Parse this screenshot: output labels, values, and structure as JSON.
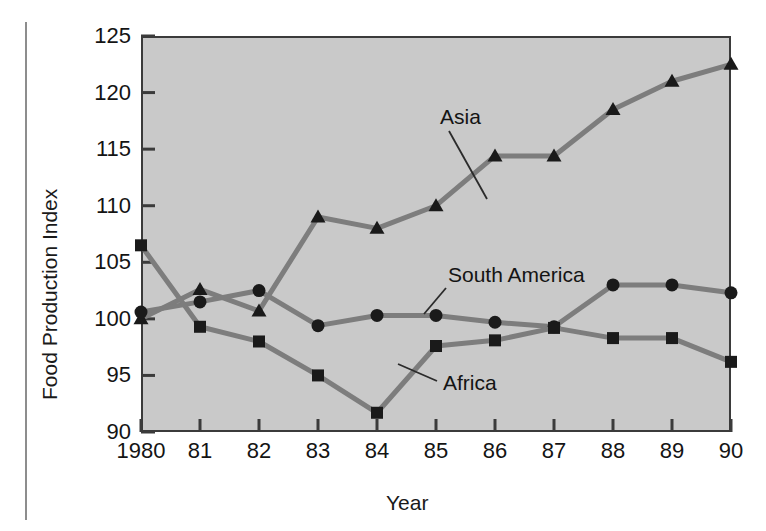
{
  "figure": {
    "background_color": "#ffffff",
    "plot_background_color": "#c9c9c9",
    "line_color": "#7d7d7d",
    "marker_color": "#1a1a1a",
    "axis_color": "#3b3b3b"
  },
  "axis_titles": {
    "y": "Food Production Index",
    "x": "Year"
  },
  "y_ticks": [
    "125",
    "120",
    "115",
    "110",
    "105",
    "100",
    "95",
    "90"
  ],
  "x_ticks": [
    "1980",
    "81",
    "82",
    "83",
    "84",
    "85",
    "86",
    "87",
    "88",
    "89",
    "90"
  ],
  "series_labels": {
    "asia": "Asia",
    "south_america": "South America",
    "africa": "Africa"
  },
  "chart_data": {
    "type": "line",
    "title": "",
    "xlabel": "Year",
    "ylabel": "Food Production Index",
    "x": [
      1980,
      1981,
      1982,
      1983,
      1984,
      1985,
      1986,
      1987,
      1988,
      1989,
      1990
    ],
    "categories": [
      "1980",
      "81",
      "82",
      "83",
      "84",
      "85",
      "86",
      "87",
      "88",
      "89",
      "90"
    ],
    "xlim": [
      1980,
      1990
    ],
    "ylim": [
      90,
      125
    ],
    "ytick_values": [
      90,
      95,
      100,
      105,
      110,
      115,
      120,
      125
    ],
    "grid": false,
    "legend": "inline-annotations",
    "series": [
      {
        "name": "Asia",
        "marker": "triangle",
        "values": [
          100.0,
          102.6,
          100.7,
          109.0,
          108.0,
          110.0,
          114.4,
          114.4,
          118.5,
          121.0,
          122.5
        ]
      },
      {
        "name": "South America",
        "marker": "circle",
        "values": [
          100.6,
          101.5,
          102.5,
          99.4,
          100.3,
          100.3,
          99.7,
          99.3,
          103.0,
          103.0,
          102.3
        ]
      },
      {
        "name": "Africa",
        "marker": "square",
        "values": [
          106.5,
          99.3,
          98.0,
          95.0,
          91.7,
          97.6,
          98.1,
          99.2,
          98.3,
          98.3,
          96.2
        ]
      }
    ],
    "annotations": [
      {
        "text": "Asia",
        "points_to_series": "Asia"
      },
      {
        "text": "South America",
        "points_to_series": "South America"
      },
      {
        "text": "Africa",
        "points_to_series": "Africa"
      }
    ]
  }
}
